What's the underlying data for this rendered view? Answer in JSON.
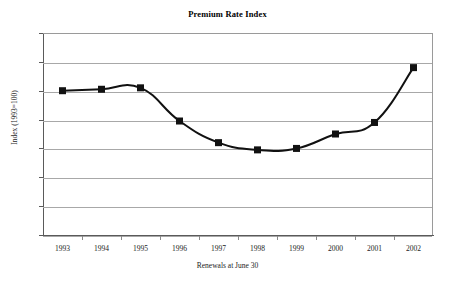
{
  "chart_data": {
    "type": "line",
    "title": "Premium Rate Index",
    "xlabel": "Renewals at June 30",
    "ylabel": "Index (1993=100)",
    "categories": [
      "1993",
      "1994",
      "1995",
      "1996",
      "1997",
      "1998",
      "1999",
      "2000",
      "2001",
      "2002"
    ],
    "values": [
      100,
      101,
      102,
      79,
      64,
      59,
      60,
      70,
      78,
      116
    ],
    "series": [
      {
        "name": "Premium Rate Index",
        "values": [
          100,
          101,
          102,
          79,
          64,
          59,
          60,
          70,
          78,
          116
        ]
      }
    ],
    "ylim": [
      0,
      140
    ],
    "y_ticks": [
      0,
      20,
      40,
      60,
      80,
      100,
      120,
      140
    ],
    "y_tick_labels": [
      "0",
      "20",
      "40",
      "60",
      "80",
      "100",
      "120",
      "140"
    ],
    "grid": true,
    "legend": "none",
    "marker": "square",
    "line_color": "#111111",
    "marker_color": "#111111",
    "grid_color": "#a8a8a8",
    "axis_color": "#5a5a5a"
  }
}
